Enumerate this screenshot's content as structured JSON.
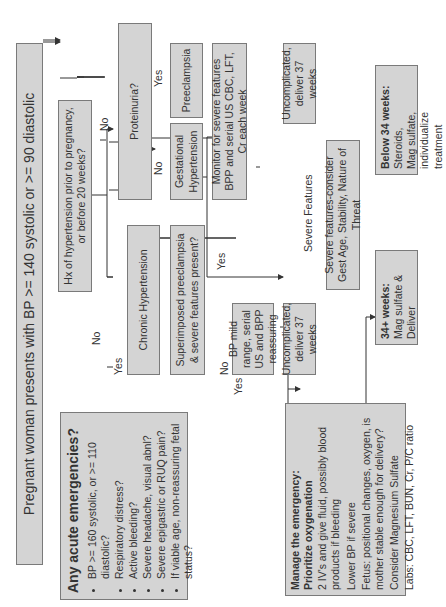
{
  "start": {
    "text": "Pregnant woman presents with BP >= 140 systolic or >= 90 diastolic"
  },
  "emergencies": {
    "heading": "Any acute emergencies?",
    "items": [
      "BP >= 160 systolic, or >= 110 diastolic?",
      "Respiratory distress?",
      "Active bleeding?",
      "Severe headache, visual abnl?",
      "Severe epigastric or RUQ pain?",
      "If viable age, non-reassuring fetal status?"
    ]
  },
  "hx": {
    "text": "Hx of hypertension prior to pregnancy, or before 20 weeks?"
  },
  "chronic": {
    "text": "Chronic Hypertension"
  },
  "superimposed": {
    "text": "Superimposed preeclampsia & severe features present?"
  },
  "proteinuria": {
    "text": "Proteinuria?"
  },
  "preeclampsia": {
    "text": "Preeclampsia"
  },
  "gestational": {
    "text": "Gestational Hypertension"
  },
  "monitor": {
    "text": "Monitor for severe features BPP and serial US CBC, LFT, Cr each week"
  },
  "bp_mild": {
    "text": "BP mild range, serial US and BPP reassuring"
  },
  "uncomplicated_1": {
    "text": "Uncomplicated, deliver 37 weeks"
  },
  "uncomplicated_2": {
    "text": "Uncomplicated, deliver 37 weeks"
  },
  "severe": {
    "text": "Severe features-consider Gest Age, Stability, Nature of Threat"
  },
  "below34": {
    "heading": "Below 34 weeks:",
    "lines": [
      "Steroids,",
      "Mag sulfate,",
      "individualize treatment"
    ]
  },
  "above34": {
    "heading": "34+ weeks:",
    "lines": [
      "Mag sulfate & Deliver"
    ]
  },
  "manage": {
    "heading1": "Manage the emergency:",
    "heading2": "Prioritize oxygenation",
    "lines": [
      "2 IV's and give fluid, possibly blood products if bleeding",
      "Lower BP if severe",
      "Fetus: positional changes, oxygen, is mother stable enough for delivery?",
      "Consider Magnesium Sulfate",
      "Labs: CBC, LFT, BUN, Cr, P/C ratio"
    ]
  },
  "labels": {
    "no_emergency": "No",
    "yes_emergency": "Yes",
    "yes_hx": "Yes",
    "no_hx": "No",
    "yes_protein": "Yes",
    "no_protein": "No",
    "yes_superimposed": "Yes",
    "no_superimposed": "No",
    "severe_features": "Severe Features"
  }
}
